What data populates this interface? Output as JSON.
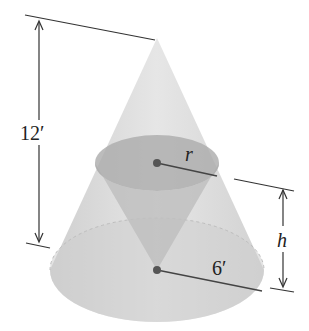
{
  "diagram": {
    "type": "inscribed-cone",
    "labels": {
      "outer_height": "12′",
      "outer_radius": "6′",
      "inner_radius": "r",
      "inner_height": "h"
    },
    "colors": {
      "outer_cone": "#d9d9d9",
      "base_ellipse": "#cfcfcf",
      "inner_top": "#b5b5b5",
      "inner_cone": "#c4c4c4",
      "lines": "#333333",
      "dot": "#555555"
    }
  }
}
